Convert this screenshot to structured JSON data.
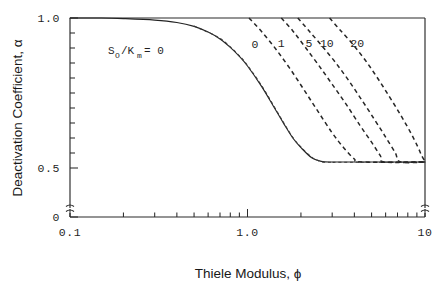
{
  "chart_data": {
    "type": "line",
    "title": "",
    "xlabel": "Thiele Modulus,  ϕ",
    "ylabel": "Deactivation Coefficient,  α",
    "xscale": "log",
    "xlim": [
      0.1,
      10
    ],
    "ylim": [
      0.0,
      1.0
    ],
    "y_axis_break": true,
    "y_break_note": "axis broken between 0 and ~0.44",
    "grid": false,
    "legend_position": "inline-curve-labels",
    "parameter_name": "S_o/K_m",
    "parameter_label_text": "S",
    "parameter_label_sub1": "O",
    "parameter_label_mid": "/K",
    "parameter_label_sub2": "m",
    "parameter_label_eq": "=  0",
    "xticks_major": [
      {
        "value": 0.1,
        "label": "0.1"
      },
      {
        "value": 1.0,
        "label": "1.0"
      },
      {
        "value": 10,
        "label": "10"
      }
    ],
    "xticks_minor": [
      0.2,
      0.3,
      0.4,
      0.5,
      0.6,
      0.7,
      0.8,
      0.9,
      2,
      3,
      4,
      5,
      6,
      7,
      8,
      9
    ],
    "yticks_major": [
      {
        "value": 0.0,
        "label": "0"
      },
      {
        "value": 0.5,
        "label": "0.5"
      },
      {
        "value": 1.0,
        "label": "1.0"
      }
    ],
    "yticks_minor": [
      0.55,
      0.6,
      0.65,
      0.7,
      0.75,
      0.8,
      0.85,
      0.9,
      0.95
    ],
    "plateau_value": 0.52,
    "series": [
      {
        "name": "solid-reference-curve",
        "style": "solid",
        "label": "",
        "x": [
          0.1,
          0.15,
          0.2,
          0.3,
          0.4,
          0.5,
          0.6,
          0.7,
          0.8,
          0.9,
          1.0,
          1.2,
          1.4,
          1.6,
          1.8,
          2.0,
          2.3,
          2.6,
          3.0,
          3.4,
          4.0,
          6.0,
          10.0
        ],
        "y": [
          1.0,
          1.0,
          0.998,
          0.993,
          0.985,
          0.972,
          0.953,
          0.93,
          0.902,
          0.872,
          0.84,
          0.772,
          0.706,
          0.648,
          0.6,
          0.568,
          0.534,
          0.522,
          0.52,
          0.52,
          0.52,
          0.52,
          0.52
        ]
      },
      {
        "name": "So/Km = 0",
        "style": "dashed-thin",
        "label": "0",
        "label_x": 1.1,
        "label_y": 0.9,
        "x": [
          0.5,
          0.7,
          0.9,
          1.0,
          1.2,
          1.4,
          1.6,
          1.8,
          2.0,
          2.3,
          2.6,
          3.0,
          3.4,
          10.0
        ],
        "y": [
          0.973,
          0.932,
          0.874,
          0.842,
          0.775,
          0.709,
          0.651,
          0.602,
          0.57,
          0.536,
          0.521,
          0.519,
          0.519,
          0.519
        ]
      },
      {
        "name": "So/Km = 1",
        "style": "dashed",
        "label": "1",
        "label_x": 1.55,
        "label_y": 0.905,
        "x": [
          1.02,
          1.2,
          1.45,
          1.75,
          2.1,
          2.5,
          3.0,
          3.5,
          4.0,
          4.4,
          10.0
        ],
        "y": [
          1.0,
          0.955,
          0.895,
          0.828,
          0.757,
          0.688,
          0.617,
          0.566,
          0.53,
          0.52,
          0.52
        ]
      },
      {
        "name": "So/Km = 5",
        "style": "dashed",
        "label": "5",
        "label_x": 2.22,
        "label_y": 0.905,
        "x": [
          1.55,
          1.8,
          2.1,
          2.5,
          3.0,
          3.6,
          4.3,
          5.0,
          5.6,
          5.9,
          10.0
        ],
        "y": [
          1.0,
          0.957,
          0.905,
          0.845,
          0.779,
          0.712,
          0.642,
          0.586,
          0.541,
          0.52,
          0.52
        ]
      },
      {
        "name": "So/Km = 10",
        "style": "dashed",
        "label": "10",
        "label_x": 2.8,
        "label_y": 0.905,
        "x": [
          1.92,
          2.2,
          2.6,
          3.1,
          3.7,
          4.4,
          5.2,
          6.0,
          6.8,
          7.3,
          10.0
        ],
        "y": [
          1.0,
          0.96,
          0.91,
          0.855,
          0.793,
          0.727,
          0.661,
          0.603,
          0.551,
          0.52,
          0.52
        ]
      },
      {
        "name": "So/Km = 20",
        "style": "dashed",
        "label": "20",
        "label_x": 4.15,
        "label_y": 0.905,
        "x": [
          2.9,
          3.3,
          3.9,
          4.6,
          5.4,
          6.3,
          7.3,
          8.3,
          9.1,
          9.6,
          10.0
        ],
        "y": [
          1.0,
          0.962,
          0.914,
          0.86,
          0.8,
          0.738,
          0.676,
          0.618,
          0.571,
          0.54,
          0.522
        ]
      }
    ]
  }
}
